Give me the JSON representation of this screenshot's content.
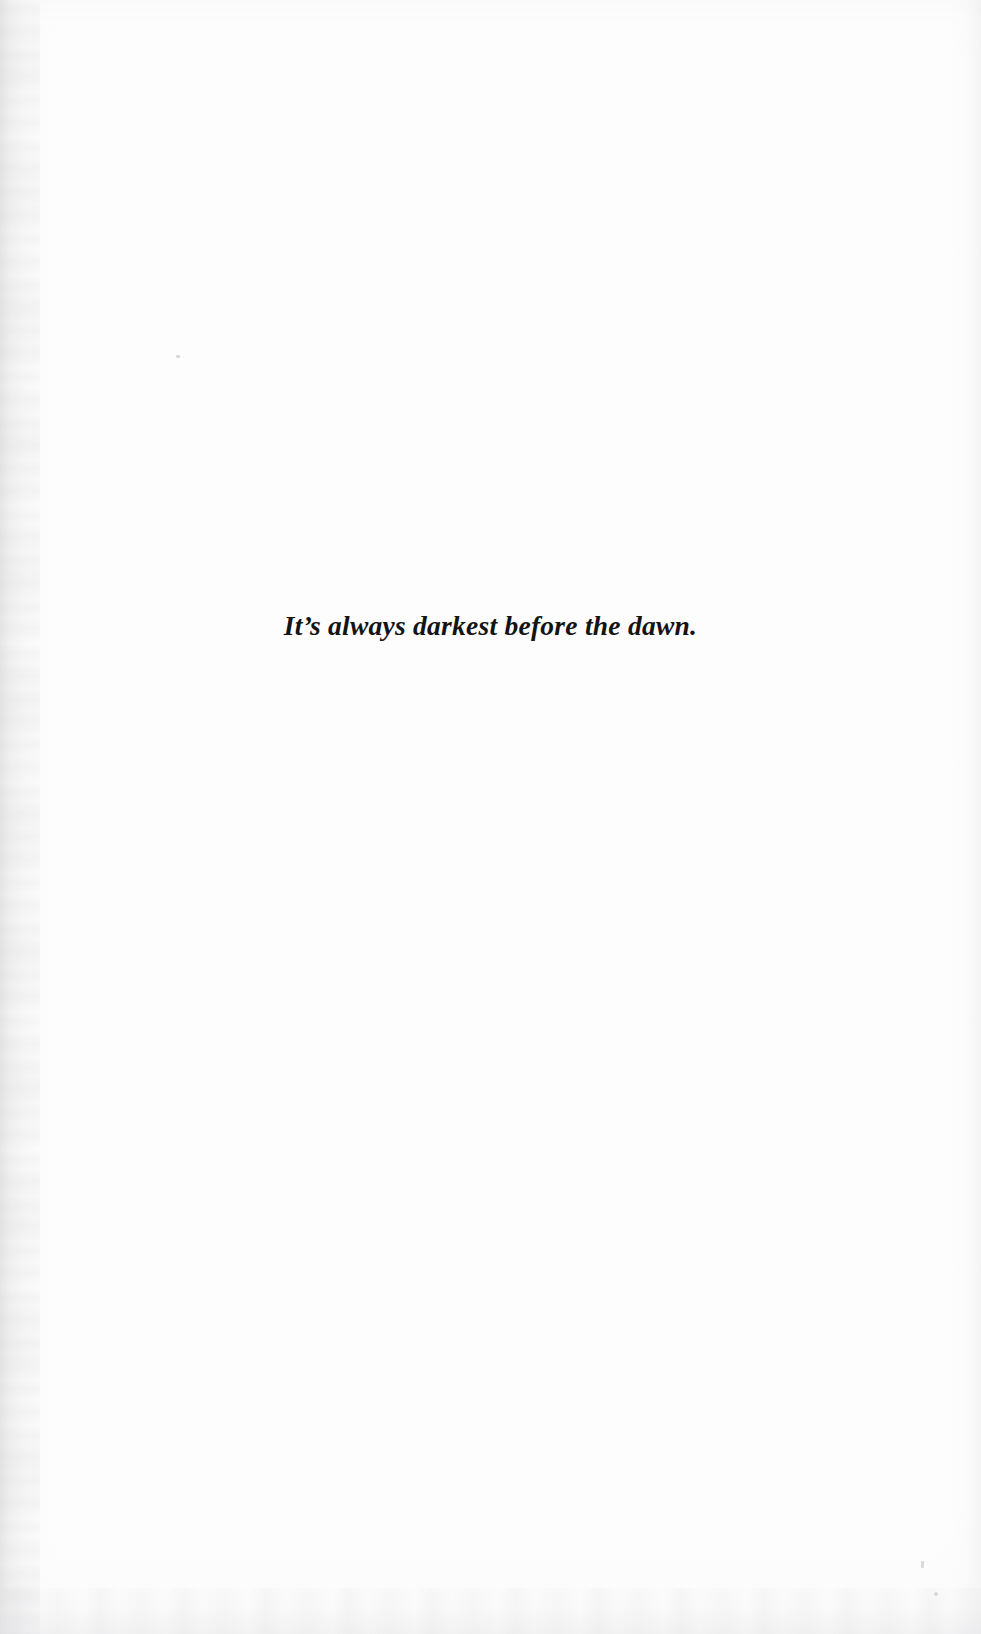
{
  "page": {
    "kind": "scanned-book-page",
    "role": "epigraph-page",
    "width": 981,
    "height": 1634,
    "background_color": "#fdfdfd",
    "paper_tone": "#ffffff",
    "ink_color": "#141414"
  },
  "epigraph": {
    "text": "It’s always darkest before the dawn.",
    "style": "italic-serif",
    "alignment": "center"
  },
  "artifacts": {
    "left_edge_shadow_color": "#c6c6c8",
    "right_edge_shadow_color": "#e0e0e3",
    "bottom_edge_shadow_color": "#dedee1",
    "top_edge_shadow_color": "#eeeef1",
    "speck_color": "#bebec2"
  }
}
